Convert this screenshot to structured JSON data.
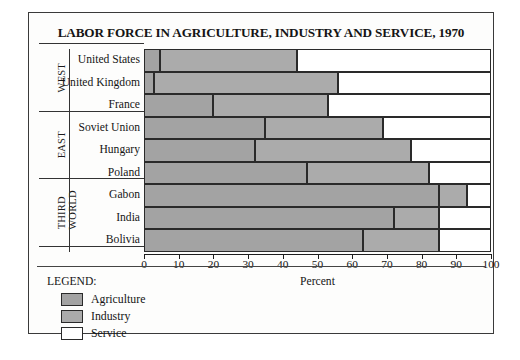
{
  "chart_data": {
    "type": "bar",
    "orientation": "horizontal",
    "stacked": true,
    "title": "LABOR FORCE IN AGRICULTURE, INDUSTRY AND SERVICE, 1970",
    "xlabel": "Percent",
    "ylabel": "",
    "xlim": [
      0,
      100
    ],
    "xticks": [
      0,
      10,
      20,
      30,
      40,
      50,
      60,
      70,
      80,
      90,
      100
    ],
    "grid": false,
    "legend_position": "bottom-left",
    "legend_title": "LEGEND:",
    "categories": [
      "United States",
      "United Kingdom",
      "France",
      "Soviet Union",
      "Hungary",
      "Poland",
      "Gabon",
      "India",
      "Bolivia"
    ],
    "groups": [
      {
        "label": "WEST",
        "lines": [
          "WEST"
        ],
        "categories": [
          "United States",
          "United Kingdom",
          "France"
        ]
      },
      {
        "label": "EAST",
        "lines": [
          "EAST"
        ],
        "categories": [
          "Soviet Union",
          "Hungary",
          "Poland"
        ]
      },
      {
        "label": "THIRD WORLD",
        "lines": [
          "THIRD",
          "WORLD"
        ],
        "categories": [
          "Gabon",
          "India",
          "Bolivia"
        ]
      }
    ],
    "series": [
      {
        "name": "Agriculture",
        "color": "#a3a3a3",
        "values": [
          4.5,
          3,
          20,
          35,
          32,
          47,
          85,
          72,
          63
        ]
      },
      {
        "name": "Industry",
        "color": "#ababab",
        "values": [
          39.5,
          53,
          33,
          34,
          45,
          35,
          8,
          13,
          22
        ]
      },
      {
        "name": "Service",
        "color": "#ffffff",
        "values": [
          56,
          44,
          47,
          31,
          23,
          18,
          7,
          15,
          15
        ]
      }
    ],
    "cumulative_boundaries": [
      {
        "category": "United States",
        "agriculture_end": 4.5,
        "industry_end": 44,
        "service_end": 100
      },
      {
        "category": "United Kingdom",
        "agriculture_end": 3,
        "industry_end": 56,
        "service_end": 100
      },
      {
        "category": "France",
        "agriculture_end": 20,
        "industry_end": 53,
        "service_end": 100
      },
      {
        "category": "Soviet Union",
        "agriculture_end": 35,
        "industry_end": 69,
        "service_end": 100
      },
      {
        "category": "Hungary",
        "agriculture_end": 32,
        "industry_end": 77,
        "service_end": 100
      },
      {
        "category": "Poland",
        "agriculture_end": 47,
        "industry_end": 82,
        "service_end": 100
      },
      {
        "category": "Gabon",
        "agriculture_end": 85,
        "industry_end": 93,
        "service_end": 100
      },
      {
        "category": "India",
        "agriculture_end": 72,
        "industry_end": 85,
        "service_end": 100
      },
      {
        "category": "Bolivia",
        "agriculture_end": 63,
        "industry_end": 85,
        "service_end": 100
      }
    ]
  },
  "legend": {
    "title": "LEGEND:",
    "items": [
      {
        "label": "Agriculture",
        "color": "#a3a3a3"
      },
      {
        "label": "Industry",
        "color": "#ababab"
      },
      {
        "label": "Service",
        "color": "#ffffff"
      }
    ]
  }
}
